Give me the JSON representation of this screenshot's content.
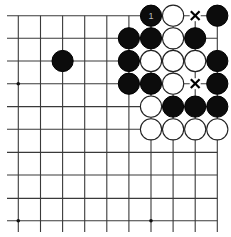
{
  "board": {
    "columns": 10,
    "rows": 10,
    "edges": {
      "top": true,
      "right": true,
      "left": false,
      "bottom": false
    },
    "colors": {
      "black": "#0c0c0c",
      "white": "#ffffff",
      "line": "#3a3a3a",
      "background": "#ffffff"
    },
    "star_points": [
      [
        0,
        3
      ],
      [
        0,
        9
      ],
      [
        6,
        9
      ]
    ],
    "stones": [
      {
        "col": 6,
        "row": 0,
        "color": "black",
        "label": "1"
      },
      {
        "col": 7,
        "row": 0,
        "color": "white"
      },
      {
        "col": 9,
        "row": 0,
        "color": "black"
      },
      {
        "col": 5,
        "row": 1,
        "color": "black"
      },
      {
        "col": 6,
        "row": 1,
        "color": "black"
      },
      {
        "col": 7,
        "row": 1,
        "color": "white"
      },
      {
        "col": 8,
        "row": 1,
        "color": "black"
      },
      {
        "col": 2,
        "row": 2,
        "color": "black"
      },
      {
        "col": 5,
        "row": 2,
        "color": "black"
      },
      {
        "col": 6,
        "row": 2,
        "color": "white"
      },
      {
        "col": 7,
        "row": 2,
        "color": "white"
      },
      {
        "col": 8,
        "row": 2,
        "color": "white"
      },
      {
        "col": 9,
        "row": 2,
        "color": "black"
      },
      {
        "col": 5,
        "row": 3,
        "color": "black"
      },
      {
        "col": 6,
        "row": 3,
        "color": "black"
      },
      {
        "col": 7,
        "row": 3,
        "color": "white"
      },
      {
        "col": 9,
        "row": 3,
        "color": "black"
      },
      {
        "col": 6,
        "row": 4,
        "color": "white"
      },
      {
        "col": 7,
        "row": 4,
        "color": "black"
      },
      {
        "col": 8,
        "row": 4,
        "color": "black"
      },
      {
        "col": 9,
        "row": 4,
        "color": "black"
      },
      {
        "col": 6,
        "row": 5,
        "color": "white"
      },
      {
        "col": 7,
        "row": 5,
        "color": "white"
      },
      {
        "col": 8,
        "row": 5,
        "color": "white"
      },
      {
        "col": 9,
        "row": 5,
        "color": "white"
      }
    ],
    "marks": [
      {
        "col": 8,
        "row": 0,
        "type": "x"
      },
      {
        "col": 8,
        "row": 3,
        "type": "x"
      }
    ]
  }
}
